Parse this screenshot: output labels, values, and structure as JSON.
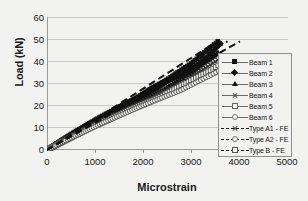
{
  "chart_data": {
    "type": "scatter",
    "title": "",
    "xlabel": "Microstrain",
    "ylabel": "Load (kN)",
    "xlim": [
      0,
      5000
    ],
    "ylim": [
      0,
      60
    ],
    "xticks": [
      "0",
      "1000",
      "2000",
      "3000",
      "4000",
      "5000"
    ],
    "yticks": [
      "0",
      "10",
      "20",
      "30",
      "40",
      "50",
      "60"
    ],
    "grid": "horizontal",
    "legend_position": "right-inside",
    "series": [
      {
        "name": "Beam 1",
        "marker": "filled-square",
        "style": "markers",
        "x": [
          0,
          200,
          420,
          640,
          880,
          1120,
          1380,
          1640,
          1900,
          2180,
          2450,
          2720,
          3000,
          3280,
          3560
        ],
        "y": [
          0,
          3,
          6,
          9,
          12,
          15,
          18,
          21,
          24,
          28,
          31,
          35,
          39,
          44,
          49
        ]
      },
      {
        "name": "Beam 2",
        "marker": "filled-diamond",
        "style": "markers",
        "x": [
          0,
          210,
          440,
          670,
          910,
          1160,
          1420,
          1690,
          1960,
          2240,
          2520,
          2810,
          3100,
          3390,
          3620
        ],
        "y": [
          0,
          3,
          6,
          9,
          12,
          15,
          18,
          21,
          24,
          27,
          31,
          34,
          38,
          43,
          48
        ]
      },
      {
        "name": "Beam 3",
        "marker": "filled-triangle",
        "style": "markers",
        "x": [
          0,
          230,
          470,
          720,
          980,
          1250,
          1530,
          1810,
          2100,
          2400,
          2700,
          3010,
          3320,
          3560
        ],
        "y": [
          0,
          3,
          6,
          9,
          12,
          15,
          18,
          21,
          24,
          27,
          31,
          35,
          40,
          44
        ]
      },
      {
        "name": "Beam 4",
        "marker": "cross",
        "style": "markers",
        "x": [
          0,
          250,
          510,
          780,
          1060,
          1350,
          1650,
          1960,
          2280,
          2610,
          2950,
          3300,
          3660
        ],
        "y": [
          0,
          3,
          6,
          9,
          12,
          15,
          18,
          21,
          25,
          28,
          32,
          37,
          42
        ]
      },
      {
        "name": "Beam 5",
        "marker": "open-square",
        "style": "markers",
        "x": [
          0,
          260,
          530,
          810,
          1100,
          1400,
          1710,
          2030,
          2360,
          2700,
          3050,
          3410,
          3780
        ],
        "y": [
          0,
          3,
          6,
          9,
          12,
          15,
          18,
          21,
          24,
          28,
          32,
          36,
          41
        ]
      },
      {
        "name": "Beam 6",
        "marker": "open-circle",
        "style": "markers",
        "x": [
          0,
          270,
          550,
          840,
          1140,
          1450,
          1770,
          2100,
          2440,
          2790,
          3150,
          3520,
          3900
        ],
        "y": [
          0,
          3,
          6,
          9,
          12,
          15,
          18,
          21,
          24,
          27,
          31,
          35,
          40
        ]
      },
      {
        "name": "Type A1 - FE",
        "marker": "none",
        "style": "dashed-line",
        "x": [
          0,
          3620
        ],
        "y": [
          0,
          50
        ]
      },
      {
        "name": "Type A2 - FE",
        "marker": "open-circle",
        "style": "dashed-line",
        "x": [
          0,
          3760
        ],
        "y": [
          0,
          49
        ]
      },
      {
        "name": "Type B - FE",
        "marker": "open-square",
        "style": "dashed-line",
        "x": [
          0,
          4020
        ],
        "y": [
          0,
          49
        ]
      }
    ]
  },
  "axes": {
    "y_title": "Load (kN)",
    "x_title": "Microstrain",
    "y_ticks": [
      "60",
      "50",
      "40",
      "30",
      "20",
      "10",
      "0"
    ],
    "x_ticks": [
      "0",
      "1000",
      "2000",
      "3000",
      "4000",
      "5000"
    ]
  },
  "legend": {
    "items": [
      {
        "label": "Beam 1",
        "marker": "filled-square",
        "line": "solid"
      },
      {
        "label": "Beam 2",
        "marker": "filled-diamond",
        "line": "solid"
      },
      {
        "label": "Beam 3",
        "marker": "filled-triangle",
        "line": "solid"
      },
      {
        "label": "Beam 4",
        "marker": "cross",
        "line": "solid"
      },
      {
        "label": "Beam 5",
        "marker": "open-square",
        "line": "solid"
      },
      {
        "label": "Beam 6",
        "marker": "open-circle",
        "line": "solid"
      },
      {
        "label": "Type A1 - FE",
        "marker": "cross",
        "line": "dashed"
      },
      {
        "label": "Type A2 - FE",
        "marker": "open-circle",
        "line": "dashed"
      },
      {
        "label": "Type B - FE",
        "marker": "open-square",
        "line": "dashed"
      }
    ]
  },
  "colors": {
    "background": "#f2f2f0",
    "grid": "#c8c8c8",
    "axis": "#9a9a9a",
    "data": "#111111"
  }
}
